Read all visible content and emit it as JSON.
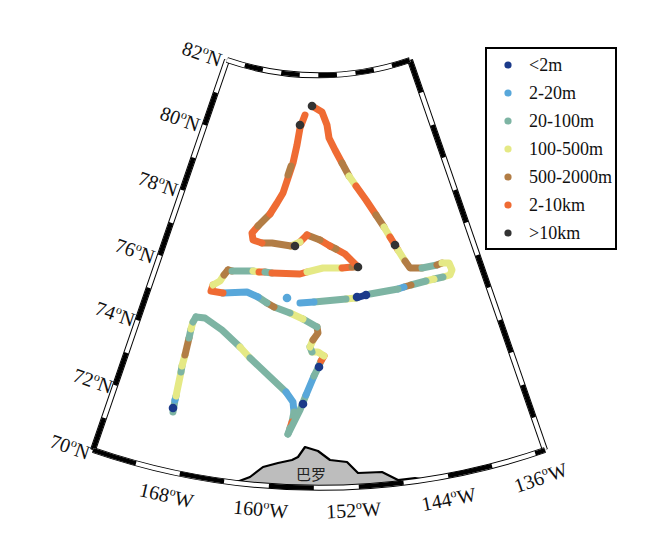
{
  "figure": {
    "lat_labels": [
      {
        "num": "82",
        "sup": "o",
        "dir": "N"
      },
      {
        "num": "80",
        "sup": "o",
        "dir": "N"
      },
      {
        "num": "78",
        "sup": "o",
        "dir": "N"
      },
      {
        "num": "76",
        "sup": "o",
        "dir": "N"
      },
      {
        "num": "74",
        "sup": "o",
        "dir": "N"
      },
      {
        "num": "72",
        "sup": "o",
        "dir": "N"
      },
      {
        "num": "70",
        "sup": "o",
        "dir": "N"
      }
    ],
    "lon_labels": [
      {
        "num": "168",
        "sup": "o",
        "dir": "W"
      },
      {
        "num": "160",
        "sup": "o",
        "dir": "W"
      },
      {
        "num": "152",
        "sup": "o",
        "dir": "W"
      },
      {
        "num": "144",
        "sup": "o",
        "dir": "W"
      },
      {
        "num": "136",
        "sup": "o",
        "dir": "W"
      }
    ],
    "land_label": "巴罗"
  },
  "legend": {
    "items": [
      {
        "label": "<2m",
        "color": "#1b3a8a"
      },
      {
        "label": "2-20m",
        "color": "#58a7da"
      },
      {
        "label": "20-100m",
        "color": "#7db4a3"
      },
      {
        "label": "100-500m",
        "color": "#e5e985"
      },
      {
        "label": "500-2000m",
        "color": "#b27d45"
      },
      {
        "label": "2-10km",
        "color": "#ef6b33"
      },
      {
        "label": ">10km",
        "color": "#333333"
      }
    ]
  },
  "map": {
    "track_runs": [
      {
        "cat": 2,
        "pts": [
          [
            173,
            412
          ],
          [
            175,
            400
          ]
        ]
      },
      {
        "cat": 1,
        "pts": [
          [
            175,
            400
          ],
          [
            176,
            396
          ]
        ]
      },
      {
        "cat": 3,
        "pts": [
          [
            176,
            396
          ],
          [
            181,
            372
          ]
        ]
      },
      {
        "cat": 2,
        "pts": [
          [
            181,
            372
          ],
          [
            182,
            366
          ]
        ]
      },
      {
        "cat": 3,
        "pts": [
          [
            182,
            366
          ],
          [
            185,
            355
          ]
        ]
      },
      {
        "cat": 4,
        "pts": [
          [
            185,
            355
          ],
          [
            189,
            338
          ]
        ]
      },
      {
        "cat": 2,
        "pts": [
          [
            189,
            338
          ],
          [
            191,
            329
          ]
        ]
      },
      {
        "cat": 3,
        "pts": [
          [
            191,
            329
          ],
          [
            193,
            322
          ]
        ]
      },
      {
        "cat": 2,
        "pts": [
          [
            193,
            322
          ],
          [
            196,
            317
          ]
        ]
      },
      {
        "cat": 2,
        "pts": [
          [
            196,
            317
          ],
          [
            205,
            318
          ],
          [
            222,
            330
          ],
          [
            240,
            347
          ]
        ]
      },
      {
        "cat": 3,
        "pts": [
          [
            240,
            347
          ],
          [
            250,
            358
          ]
        ]
      },
      {
        "cat": 2,
        "pts": [
          [
            250,
            358
          ],
          [
            268,
            375
          ],
          [
            286,
            392
          ]
        ]
      },
      {
        "cat": 1,
        "pts": [
          [
            286,
            392
          ],
          [
            293,
            402
          ],
          [
            294,
            412
          ]
        ]
      },
      {
        "cat": 2,
        "pts": [
          [
            294,
            412
          ],
          [
            292,
            422
          ]
        ]
      },
      {
        "cat": 5,
        "pts": [
          [
            292,
            422
          ],
          [
            290,
            428
          ]
        ]
      },
      {
        "cat": 2,
        "pts": [
          [
            290,
            428
          ],
          [
            288,
            434
          ]
        ]
      },
      {
        "cat": 2,
        "pts": [
          [
            288,
            434
          ],
          [
            295,
            420
          ],
          [
            300,
            410
          ],
          [
            306,
            395
          ]
        ]
      },
      {
        "cat": 1,
        "pts": [
          [
            306,
            395
          ],
          [
            314,
            376
          ]
        ]
      },
      {
        "cat": 2,
        "pts": [
          [
            314,
            376
          ],
          [
            318,
            368
          ],
          [
            321,
            361
          ]
        ]
      },
      {
        "cat": 5,
        "pts": [
          [
            321,
            361
          ],
          [
            324,
            356
          ]
        ]
      },
      {
        "cat": 3,
        "pts": [
          [
            324,
            356
          ],
          [
            318,
            352
          ],
          [
            312,
            352
          ]
        ]
      },
      {
        "cat": 2,
        "pts": [
          [
            312,
            352
          ],
          [
            310,
            347
          ]
        ]
      },
      {
        "cat": 3,
        "pts": [
          [
            310,
            347
          ],
          [
            313,
            340
          ]
        ]
      },
      {
        "cat": 4,
        "pts": [
          [
            313,
            340
          ],
          [
            318,
            333
          ],
          [
            317,
            327
          ]
        ]
      },
      {
        "cat": 2,
        "pts": [
          [
            317,
            327
          ],
          [
            303,
            319
          ]
        ]
      },
      {
        "cat": 3,
        "pts": [
          [
            303,
            319
          ],
          [
            290,
            313
          ]
        ]
      },
      {
        "cat": 2,
        "pts": [
          [
            290,
            313
          ],
          [
            274,
            307
          ]
        ]
      },
      {
        "cat": 4,
        "pts": [
          [
            274,
            307
          ],
          [
            267,
            303
          ]
        ]
      },
      {
        "cat": 2,
        "pts": [
          [
            267,
            303
          ],
          [
            258,
            297
          ]
        ]
      },
      {
        "cat": 1,
        "pts": [
          [
            258,
            297
          ],
          [
            247,
            292
          ],
          [
            223,
            293
          ]
        ]
      },
      {
        "cat": 5,
        "pts": [
          [
            223,
            293
          ],
          [
            211,
            291
          ],
          [
            213,
            285
          ]
        ]
      },
      {
        "cat": 3,
        "pts": [
          [
            213,
            285
          ],
          [
            220,
            281
          ],
          [
            224,
            275
          ]
        ]
      },
      {
        "cat": 4,
        "pts": [
          [
            224,
            275
          ],
          [
            228,
            270
          ]
        ]
      },
      {
        "cat": 4,
        "pts": [
          [
            228,
            270
          ],
          [
            232,
            271
          ]
        ]
      },
      {
        "cat": 2,
        "pts": [
          [
            232,
            271
          ],
          [
            253,
            271
          ]
        ]
      },
      {
        "cat": 3,
        "pts": [
          [
            253,
            271
          ],
          [
            259,
            272
          ]
        ]
      },
      {
        "cat": 5,
        "pts": [
          [
            259,
            272
          ],
          [
            265,
            272
          ]
        ]
      },
      {
        "cat": 2,
        "pts": [
          [
            265,
            272
          ],
          [
            272,
            273
          ]
        ]
      },
      {
        "cat": 5,
        "pts": [
          [
            272,
            273
          ],
          [
            300,
            274
          ],
          [
            307,
            272
          ]
        ]
      },
      {
        "cat": 3,
        "pts": [
          [
            307,
            272
          ],
          [
            323,
            268
          ],
          [
            342,
            268
          ]
        ]
      },
      {
        "cat": 5,
        "pts": [
          [
            342,
            268
          ],
          [
            352,
            267
          ]
        ]
      },
      {
        "cat": 4,
        "pts": [
          [
            352,
            267
          ],
          [
            358,
            267
          ]
        ]
      },
      {
        "cat": 5,
        "pts": [
          [
            358,
            267
          ],
          [
            353,
            262
          ],
          [
            345,
            254
          ],
          [
            336,
            249
          ]
        ]
      },
      {
        "cat": 4,
        "pts": [
          [
            336,
            249
          ],
          [
            330,
            246
          ]
        ]
      },
      {
        "cat": 5,
        "pts": [
          [
            330,
            246
          ],
          [
            320,
            240
          ]
        ]
      },
      {
        "cat": 4,
        "pts": [
          [
            320,
            240
          ],
          [
            307,
            235
          ]
        ]
      },
      {
        "cat": 5,
        "pts": [
          [
            307,
            235
          ],
          [
            300,
            242
          ]
        ]
      },
      {
        "cat": 3,
        "pts": [
          [
            300,
            242
          ],
          [
            291,
            246
          ]
        ]
      },
      {
        "cat": 4,
        "pts": [
          [
            291,
            246
          ],
          [
            272,
            243
          ],
          [
            262,
            243
          ]
        ]
      },
      {
        "cat": 5,
        "pts": [
          [
            262,
            243
          ],
          [
            253,
            240
          ],
          [
            252,
            233
          ],
          [
            258,
            226
          ]
        ]
      },
      {
        "cat": 4,
        "pts": [
          [
            258,
            226
          ],
          [
            270,
            214
          ]
        ]
      },
      {
        "cat": 5,
        "pts": [
          [
            270,
            214
          ],
          [
            277,
            203
          ],
          [
            283,
            193
          ],
          [
            288,
            178
          ],
          [
            293,
            163
          ],
          [
            297,
            145
          ],
          [
            300,
            128
          ],
          [
            305,
            115
          ]
        ]
      },
      {
        "cat": 4,
        "pts": [
          [
            288,
            175
          ],
          [
            291,
            166
          ]
        ]
      },
      {
        "cat": 5,
        "pts": [
          [
            312,
            106
          ],
          [
            322,
            112
          ],
          [
            327,
            125
          ],
          [
            329,
            138
          ],
          [
            335,
            150
          ],
          [
            342,
            163
          ]
        ]
      },
      {
        "cat": 4,
        "pts": [
          [
            342,
            163
          ],
          [
            349,
            176
          ]
        ]
      },
      {
        "cat": 3,
        "pts": [
          [
            349,
            176
          ],
          [
            356,
            186
          ]
        ]
      },
      {
        "cat": 5,
        "pts": [
          [
            356,
            186
          ],
          [
            366,
            200
          ],
          [
            376,
            215
          ]
        ]
      },
      {
        "cat": 4,
        "pts": [
          [
            376,
            215
          ],
          [
            384,
            227
          ]
        ]
      },
      {
        "cat": 3,
        "pts": [
          [
            384,
            227
          ],
          [
            390,
            237
          ]
        ]
      },
      {
        "cat": 5,
        "pts": [
          [
            390,
            237
          ],
          [
            398,
            250
          ]
        ]
      },
      {
        "cat": 3,
        "pts": [
          [
            398,
            250
          ],
          [
            405,
            261
          ]
        ]
      },
      {
        "cat": 4,
        "pts": [
          [
            405,
            261
          ],
          [
            410,
            268
          ],
          [
            422,
            268
          ]
        ]
      },
      {
        "cat": 2,
        "pts": [
          [
            422,
            268
          ],
          [
            437,
            265
          ]
        ]
      },
      {
        "cat": 4,
        "pts": [
          [
            437,
            265
          ],
          [
            442,
            263
          ]
        ]
      },
      {
        "cat": 3,
        "pts": [
          [
            442,
            263
          ],
          [
            449,
            263
          ],
          [
            452,
            270
          ],
          [
            450,
            275
          ],
          [
            443,
            277
          ]
        ]
      },
      {
        "cat": 2,
        "pts": [
          [
            443,
            277
          ],
          [
            434,
            279
          ]
        ]
      },
      {
        "cat": 3,
        "pts": [
          [
            434,
            279
          ],
          [
            426,
            281
          ]
        ]
      },
      {
        "cat": 2,
        "pts": [
          [
            426,
            281
          ],
          [
            411,
            285
          ]
        ]
      },
      {
        "cat": 4,
        "pts": [
          [
            411,
            285
          ],
          [
            404,
            287
          ]
        ]
      },
      {
        "cat": 1,
        "pts": [
          [
            404,
            287
          ],
          [
            398,
            289
          ]
        ]
      },
      {
        "cat": 2,
        "pts": [
          [
            398,
            289
          ],
          [
            370,
            294
          ]
        ]
      },
      {
        "cat": 0,
        "pts": [
          [
            366,
            295
          ],
          [
            356,
            298
          ]
        ]
      },
      {
        "cat": 3,
        "pts": [
          [
            356,
            298
          ],
          [
            346,
            299
          ]
        ]
      },
      {
        "cat": 2,
        "pts": [
          [
            346,
            299
          ],
          [
            314,
            302
          ]
        ]
      },
      {
        "cat": 1,
        "pts": [
          [
            314,
            302
          ],
          [
            300,
            303
          ]
        ]
      }
    ],
    "markers": [
      {
        "cat": 0,
        "x": 173,
        "y": 408
      },
      {
        "cat": 0,
        "x": 303,
        "y": 404
      },
      {
        "cat": 0,
        "x": 319,
        "y": 367
      },
      {
        "cat": 0,
        "x": 366,
        "y": 295
      },
      {
        "cat": 0,
        "x": 357,
        "y": 297
      },
      {
        "cat": 1,
        "x": 287,
        "y": 298
      },
      {
        "cat": 6,
        "x": 312,
        "y": 106
      },
      {
        "cat": 6,
        "x": 300,
        "y": 125
      },
      {
        "cat": 6,
        "x": 295,
        "y": 246
      },
      {
        "cat": 6,
        "x": 358,
        "y": 267
      },
      {
        "cat": 6,
        "x": 395,
        "y": 245
      }
    ]
  }
}
